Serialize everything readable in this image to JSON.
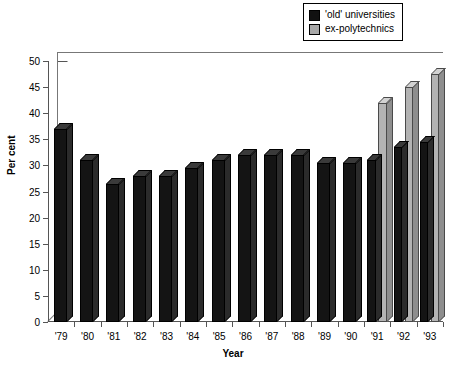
{
  "legend": {
    "position": "top-right",
    "items": [
      {
        "label": "'old' universities",
        "color": "#141414",
        "key": "old_universities"
      },
      {
        "label": "ex-polytechnics",
        "color": "#b3b3b3",
        "key": "ex_polytechnics"
      }
    ]
  },
  "axis": {
    "y_title": "Per cent",
    "x_title": "Year"
  },
  "caption": {
    "text": ""
  },
  "chart_data": {
    "type": "bar",
    "title": "",
    "xlabel": "Year",
    "ylabel": "Per cent",
    "ylim": [
      0,
      50
    ],
    "yticks": [
      0,
      5,
      10,
      15,
      20,
      25,
      30,
      35,
      40,
      45,
      50
    ],
    "ytick_labels": [
      "0",
      "5",
      "10",
      "15",
      "20",
      "25",
      "30",
      "35",
      "40",
      "45",
      "50"
    ],
    "grid": false,
    "legend_position": "top-right",
    "style": "3d-bar",
    "categories": [
      "'79",
      "'80",
      "'81",
      "'82",
      "'83",
      "'84",
      "'85",
      "'86",
      "'87",
      "'88",
      "'89",
      "'90",
      "'91",
      "'92",
      "'93"
    ],
    "series": [
      {
        "name": "'old' universities",
        "color": "#141414",
        "values": [
          37,
          31,
          26.5,
          28,
          28,
          29.5,
          31,
          32,
          32,
          32,
          30.5,
          30.5,
          31,
          33.5,
          34.5
        ]
      },
      {
        "name": "ex-polytechnics",
        "color": "#b3b3b3",
        "values": [
          null,
          null,
          null,
          null,
          null,
          null,
          null,
          null,
          null,
          null,
          null,
          null,
          42,
          45,
          47.5
        ]
      }
    ]
  }
}
